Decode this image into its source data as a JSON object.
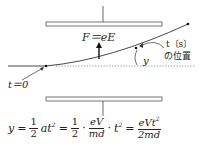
{
  "diagram": {
    "force_label": "F＝eE",
    "time_label": "t〔s〕",
    "position_label": "の位置",
    "displacement_label": "y",
    "start_label": "t＝0",
    "colors": {
      "line": "#333333",
      "plate_fill": "#ffffff",
      "plate_stroke": "#555555",
      "dotted": "#777777"
    }
  },
  "formula": {
    "lhs": "y",
    "eq1": "=",
    "half_num": "1",
    "half_den": "2",
    "at2": "at",
    "sq": "2",
    "eq2": "=",
    "half2_num": "1",
    "half2_den": "2",
    "dot1": "·",
    "ev_num": "eV",
    "md_den": "md",
    "dot2": "·",
    "t2": "t",
    "sq2": "2",
    "eq3": "=",
    "res_num": "eVt",
    "res_sq": "2",
    "res_den": "2md"
  }
}
